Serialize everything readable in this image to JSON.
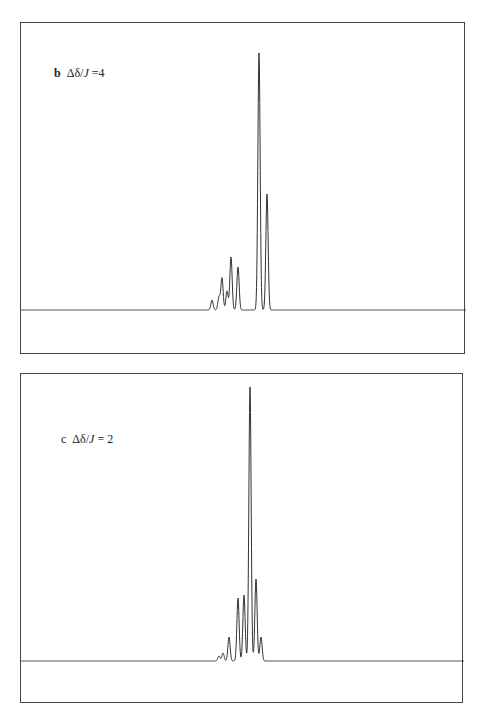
{
  "chart_data": [
    {
      "type": "line",
      "panel": "b",
      "title": "Δδ/J = 4",
      "panel_letter": "b",
      "ratio_label": "Δδ/",
      "ratio_var": "J",
      "ratio_value": "=4",
      "xlabel": "",
      "ylabel": "",
      "axes_ticks": "none",
      "grid": false,
      "description": "Simulated NMR multiplet spectrum; relative peak intensities",
      "peaks": [
        {
          "x": 211,
          "height": 10
        },
        {
          "x": 218,
          "height": 13
        },
        {
          "x": 221,
          "height": 32
        },
        {
          "x": 226,
          "height": 19
        },
        {
          "x": 230,
          "height": 53
        },
        {
          "x": 237,
          "height": 43
        },
        {
          "x": 258,
          "height": 257
        },
        {
          "x": 266,
          "height": 116
        }
      ]
    },
    {
      "type": "line",
      "panel": "c",
      "title": "Δδ/J = 2",
      "panel_letter": "c",
      "ratio_label": "Δδ/",
      "ratio_var": "J",
      "ratio_value": "= 2",
      "xlabel": "",
      "ylabel": "",
      "axes_ticks": "none",
      "grid": false,
      "description": "Simulated NMR multiplet spectrum; relative peak intensities",
      "peaks": [
        {
          "x": 218,
          "height": 5
        },
        {
          "x": 222,
          "height": 8
        },
        {
          "x": 228,
          "height": 24
        },
        {
          "x": 237,
          "height": 63
        },
        {
          "x": 243,
          "height": 66
        },
        {
          "x": 249,
          "height": 274
        },
        {
          "x": 255,
          "height": 82
        },
        {
          "x": 260,
          "height": 24
        }
      ]
    }
  ],
  "panels": {
    "b": {
      "letter": "b",
      "ratio_label": "Δδ/",
      "ratio_var": "J",
      "ratio_value": " =4"
    },
    "c": {
      "letter": "c",
      "ratio_label": "Δδ/",
      "ratio_var": "J",
      "ratio_value": " = 2"
    }
  }
}
